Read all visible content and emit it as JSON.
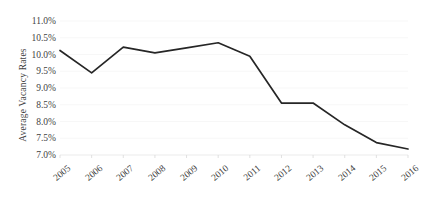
{
  "chart_data": {
    "type": "line",
    "title": "",
    "xlabel": "",
    "ylabel": "Average Vacancy Rates",
    "categories": [
      "2005",
      "2006",
      "2007",
      "2008",
      "2009",
      "2010",
      "2011",
      "2012",
      "2013",
      "2014",
      "2015",
      "2016"
    ],
    "values": [
      10.12,
      9.45,
      10.22,
      10.05,
      10.2,
      10.35,
      9.95,
      8.55,
      8.55,
      7.9,
      7.37,
      7.18
    ],
    "series": [
      {
        "name": "Average Vacancy Rates",
        "values": [
          10.12,
          9.45,
          10.22,
          10.05,
          10.2,
          10.35,
          9.95,
          8.55,
          8.55,
          7.9,
          7.37,
          7.18
        ]
      }
    ],
    "ylim": [
      7.0,
      11.0
    ],
    "ytick_values": [
      11.0,
      10.5,
      10.0,
      9.5,
      9.0,
      8.5,
      8.0,
      7.5,
      7.0
    ],
    "ytick_labels": [
      "11.0%",
      "10.5%",
      "10.0%",
      "9.5%",
      "9.0%",
      "8.5%",
      "8.0%",
      "7.5%",
      "7.0%"
    ],
    "grid": true,
    "legend": "none",
    "line_color": "#262626",
    "gridline_color": "#f2f2f2"
  },
  "axes": {
    "y_title": "Average Vacancy Rates"
  }
}
